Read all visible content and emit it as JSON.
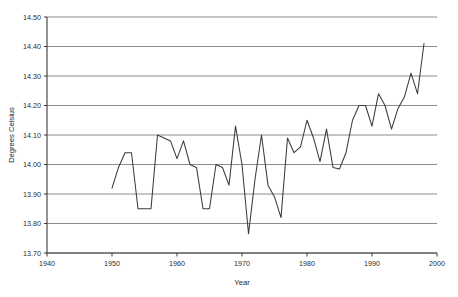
{
  "chart_data": {
    "type": "line",
    "title": "",
    "xlabel": "Year",
    "ylabel": "Degrees Celsius",
    "xlim": [
      1940,
      2000
    ],
    "ylim": [
      13.7,
      14.5
    ],
    "grid": true,
    "legend": false,
    "xticks": [
      1940,
      1950,
      1960,
      1970,
      1980,
      1990,
      2000
    ],
    "xtick_labels": [
      "1940",
      "1950",
      "1960",
      "1970",
      "1980",
      "1990",
      "2000"
    ],
    "yticks": [
      13.7,
      13.8,
      13.9,
      14.0,
      14.1,
      14.2,
      14.3,
      14.4,
      14.5
    ],
    "ytick_labels": [
      "13.70",
      "13.80",
      "13.90",
      "14.00",
      "14.10",
      "14.20",
      "14.30",
      "14.40",
      "14.50"
    ],
    "line_color": "#3a3a3a",
    "grid_color": "#808080",
    "axis_color": "#3a3a3a",
    "series": [
      {
        "name": "Global mean temperature",
        "x": [
          1950,
          1951,
          1952,
          1953,
          1954,
          1955,
          1956,
          1957,
          1958,
          1959,
          1960,
          1961,
          1962,
          1963,
          1964,
          1965,
          1966,
          1967,
          1968,
          1969,
          1970,
          1971,
          1972,
          1973,
          1974,
          1975,
          1976,
          1977,
          1978,
          1979,
          1980,
          1981,
          1982,
          1983,
          1984,
          1985,
          1986,
          1987,
          1988,
          1989,
          1990,
          1991,
          1992,
          1993,
          1994,
          1995,
          1996,
          1997,
          1998
        ],
        "values": [
          13.92,
          13.99,
          14.04,
          14.04,
          13.85,
          13.85,
          13.85,
          14.1,
          14.09,
          14.08,
          14.02,
          14.08,
          14.0,
          13.99,
          13.85,
          13.85,
          14.0,
          13.99,
          13.93,
          14.13,
          14.0,
          13.765,
          13.95,
          14.1,
          13.93,
          13.89,
          13.82,
          14.09,
          14.04,
          14.06,
          14.15,
          14.09,
          14.01,
          14.12,
          13.99,
          13.985,
          14.04,
          14.15,
          14.2,
          14.2,
          14.13,
          14.24,
          14.2,
          14.12,
          14.19,
          14.23,
          14.31,
          14.24,
          14.41
        ]
      }
    ]
  }
}
